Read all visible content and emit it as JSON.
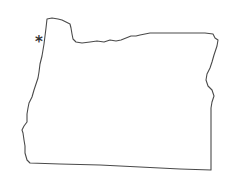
{
  "map": {
    "region": "Oregon",
    "style": "outline",
    "outline_color": "#4a4a4a",
    "background": "#ffffff"
  },
  "marker": {
    "symbol": "*",
    "icon": "asterisk-icon",
    "color": "#333333"
  }
}
